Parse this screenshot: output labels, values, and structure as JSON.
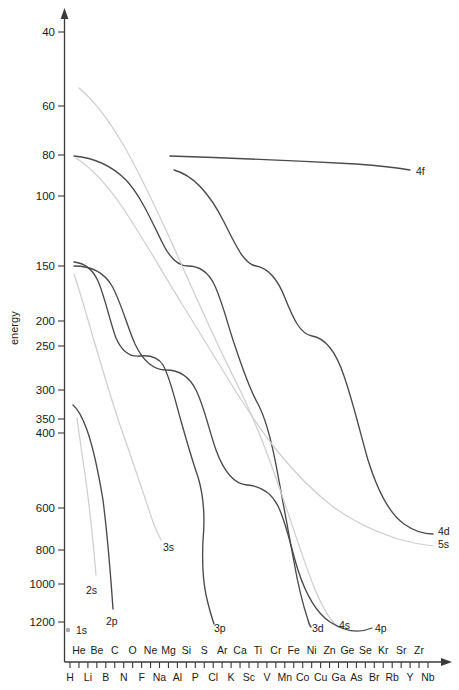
{
  "figure": {
    "ylabel": "energy",
    "xlabel": "",
    "title": ""
  },
  "chart_data": {
    "type": "line",
    "title": "",
    "xlabel": "",
    "ylabel": "energy",
    "yscale": "log-like-inverted",
    "ylim": [
      40,
      1200
    ],
    "grid": false,
    "legend": "inline-end-labels",
    "ytick_labels": [
      "40",
      "60",
      "80",
      "100",
      "150",
      "200",
      "250",
      "300",
      "350",
      "400",
      "600",
      "800",
      "1000",
      "1200"
    ],
    "ytick_values": [
      40,
      60,
      80,
      100,
      150,
      200,
      250,
      300,
      350,
      400,
      600,
      800,
      1000,
      1200
    ],
    "ytick_pixels": [
      32,
      106,
      155,
      196,
      266,
      321,
      346,
      390,
      419,
      433,
      508,
      550,
      584,
      622
    ],
    "x_categories_top": [
      "He",
      "Be",
      "C",
      "O",
      "Ne",
      "Mg",
      "Si",
      "S",
      "Ar",
      "Ca",
      "Ti",
      "Cr",
      "Fe",
      "Ni",
      "Zn",
      "Ge",
      "Se",
      "Kr",
      "Sr",
      "Zr"
    ],
    "x_categories_bottom": [
      "H",
      "Li",
      "B",
      "N",
      "F",
      "Na",
      "Al",
      "P",
      "Cl",
      "K",
      "Sc",
      "V",
      "Mn",
      "Co",
      "Cu",
      "Ga",
      "As",
      "Br",
      "Rb",
      "Y",
      "Nb"
    ],
    "series": [
      {
        "name": "1s",
        "label": "1s",
        "color": "#a8a8a8",
        "style": "marker-only",
        "label_pos": {
          "x": 76,
          "y": 634
        },
        "marker_pos": {
          "x": 68,
          "y": 630
        },
        "path": ""
      },
      {
        "name": "2s",
        "label": "2s",
        "color": "#cfcfcf",
        "style": "line",
        "label_pos": {
          "x": 86,
          "y": 594
        },
        "path": "M 77,418 C 80,440 82,455 85,474 C 89,502 93,540 96,575"
      },
      {
        "name": "2p",
        "label": "2p",
        "color": "#4a4a4a",
        "style": "line",
        "label_pos": {
          "x": 106,
          "y": 625
        },
        "path": "M 73,405 C 78,409 83,419 87,430 C 92,444 98,470 103,500 C 108,540 111,580 113,609"
      },
      {
        "name": "3s",
        "label": "3s",
        "color": "#cfcfcf",
        "style": "line",
        "label_pos": {
          "x": 163,
          "y": 551
        },
        "path": "M 74,274 C 82,298 88,320 95,344 C 104,374 112,402 121,428 C 132,459 143,492 154,525 C 157,532 159,536 161,540"
      },
      {
        "name": "3p",
        "label": "3p",
        "color": "#4a4a4a",
        "style": "line",
        "label_pos": {
          "x": 214,
          "y": 632
        },
        "path": "M 74,262 C 84,263 92,268 98,281 C 105,297 110,322 116,338 C 123,354 132,357 140,356 C 150,355 158,357 163,365 C 170,377 175,400 181,421 C 187,442 192,460 198,477 C 204,497 205,519 203,540 C 202,561 203,580 206,595 C 209,608 212,618 214,624"
      },
      {
        "name": "3d",
        "label": "3d",
        "color": "#4a4a4a",
        "style": "line",
        "label_pos": {
          "x": 312,
          "y": 632
        },
        "path": "M 74,156 C 96,158 112,166 126,180 C 141,196 152,222 162,242 C 170,259 178,266 188,266 C 199,266 208,272 214,284 C 222,300 228,326 235,346 C 243,370 250,390 258,404 C 266,419 272,443 277,470 C 282,498 288,530 294,562 C 299,590 304,608 308,620 C 309,624 310,626 311,627"
      },
      {
        "name": "4s",
        "label": "4s",
        "color": "#cfcfcf",
        "style": "line",
        "label_pos": {
          "x": 339,
          "y": 629
        },
        "path": "M 79,88 C 96,102 110,122 124,146 C 139,172 152,200 165,228 C 178,256 190,284 202,310 C 214,337 226,362 238,386 C 252,414 264,444 276,478 C 288,512 300,550 312,582 C 322,608 330,620 337,626"
      },
      {
        "name": "4p",
        "label": "4p",
        "color": "#4a4a4a",
        "style": "line",
        "label_pos": {
          "x": 375,
          "y": 632
        },
        "path": "M 74,266 C 92,266 104,272 112,286 C 121,302 127,326 135,344 C 144,363 154,370 166,370 C 179,370 189,376 196,390 C 204,406 209,430 216,450 C 224,472 234,484 247,485 C 260,486 271,492 278,506 C 286,522 291,548 298,570 C 307,598 318,614 330,622 C 344,631 358,634 372,628"
      },
      {
        "name": "4d",
        "label": "4d",
        "color": "#4a4a4a",
        "style": "line",
        "label_pos": {
          "x": 438,
          "y": 535
        },
        "path": "M 174,170 C 196,176 212,198 224,222 C 236,246 244,264 256,266 C 268,268 278,280 285,298 C 293,318 300,334 312,336 C 325,338 336,352 344,376 C 353,402 360,432 368,460 C 378,492 390,514 404,524 C 414,531 424,534 433,534"
      },
      {
        "name": "5s",
        "label": "5s",
        "color": "#cfcfcf",
        "style": "line",
        "label_pos": {
          "x": 438,
          "y": 548
        },
        "path": "M 76,158 C 98,172 116,196 132,222 C 150,250 166,278 182,304 C 198,330 214,356 230,382 C 246,408 262,432 278,452 C 296,474 314,492 332,506 C 352,521 376,532 398,539 C 412,543 424,545 433,546"
      },
      {
        "name": "4f",
        "label": "4f",
        "color": "#4a4a4a",
        "style": "line",
        "label_pos": {
          "x": 416,
          "y": 175
        },
        "path": "M 170,156 C 230,158 300,161 356,164 C 382,166 398,168 410,170"
      }
    ]
  }
}
